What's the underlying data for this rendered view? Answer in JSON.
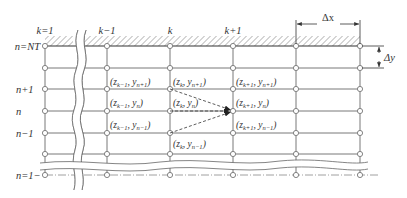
{
  "colors": {
    "line": "#7a7a7a",
    "node": "#8a8a8a",
    "text": "#333333",
    "background": "#ffffff"
  },
  "columns": [
    {
      "label": "k=1",
      "x": 45
    },
    {
      "label": "k−1",
      "x": 107
    },
    {
      "label": "k",
      "x": 170
    },
    {
      "label": "k+1",
      "x": 233
    },
    {
      "label": "",
      "x": 296
    },
    {
      "label": "",
      "x": 360
    }
  ],
  "rows": [
    {
      "label": "n=NT",
      "y": 46
    },
    {
      "label": "",
      "y": 68
    },
    {
      "label": "n+1",
      "y": 89
    },
    {
      "label": "n",
      "y": 111
    },
    {
      "label": "n−1",
      "y": 133
    },
    {
      "label": "",
      "y": 154
    },
    {
      "label": "n=1−",
      "y": 175
    }
  ],
  "column_labels": {
    "k1": "k=1",
    "km1": "k−1",
    "k": "k",
    "kp1": "k+1"
  },
  "row_labels": {
    "nt": "n=NT",
    "np1": "n+1",
    "n": "n",
    "nm1": "n−1",
    "n1": "n=1−"
  },
  "dimensions": {
    "dx": "Δx",
    "dy": "Δy"
  },
  "node_labels": [
    {
      "id": "km1_np1",
      "text": "(z",
      "sub1": "k−1",
      "mid": ", y",
      "sub2": "n+1",
      "end": ")"
    },
    {
      "id": "k_np1",
      "text": "(z",
      "sub1": "k",
      "mid": ", y",
      "sub2": "n+1",
      "end": ")"
    },
    {
      "id": "kp1_np1",
      "text": "(z",
      "sub1": "k+1",
      "mid": ", y",
      "sub2": "n+1",
      "end": ")"
    },
    {
      "id": "km1_n",
      "text": "(z",
      "sub1": "k−1",
      "mid": ", y",
      "sub2": "n",
      "end": ")"
    },
    {
      "id": "k_n",
      "text": "(z",
      "sub1": "k",
      "mid": ", y",
      "sub2": "n",
      "end": ")"
    },
    {
      "id": "kp1_n",
      "text": "(z",
      "sub1": "k+1",
      "mid": ", y",
      "sub2": "n",
      "end": ")"
    },
    {
      "id": "km1_nm1",
      "text": "(z",
      "sub1": "k−1",
      "mid": ", y",
      "sub2": "n−1",
      "end": ")"
    },
    {
      "id": "kp1_nm1",
      "text": "(z",
      "sub1": "k+1",
      "mid": ", y",
      "sub2": "n−1",
      "end": ")"
    },
    {
      "id": "k_nm1",
      "text": "(z",
      "sub1": "k",
      "mid": ", y",
      "sub2": "n−1",
      "end": ")"
    }
  ]
}
